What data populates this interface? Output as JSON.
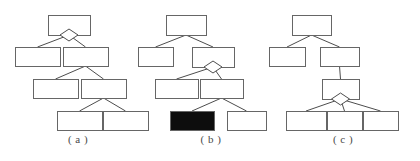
{
  "figure": {
    "type": "tree-diagram",
    "background_color": "#ffffff",
    "node_fill": "#ffffff",
    "node_stroke": "#666666",
    "node_highlight_fill": "#0d0d0d",
    "edge_color": "#4d4d4d",
    "diamond_stroke": "#4d4d4d",
    "caption_color": "#4a4a4a",
    "width": 420,
    "height": 161,
    "panel_count": 3
  },
  "panels": [
    {
      "id": "panel-a",
      "caption": "( a )",
      "caption_x": 78,
      "caption_y": 133,
      "marker_node": "root",
      "highlight_node": null,
      "levels": 4,
      "nodes": [
        {
          "id": "a-n0",
          "level": 0,
          "x": 48,
          "y": 15,
          "w": 42,
          "h": 20,
          "marker": true,
          "highlight": false
        },
        {
          "id": "a-n1",
          "level": 1,
          "x": 15,
          "y": 47,
          "w": 45,
          "h": 19,
          "marker": false,
          "highlight": false
        },
        {
          "id": "a-n2",
          "level": 1,
          "x": 63,
          "y": 47,
          "w": 45,
          "h": 19,
          "marker": false,
          "highlight": false
        },
        {
          "id": "a-n3",
          "level": 2,
          "x": 33,
          "y": 79,
          "w": 45,
          "h": 19,
          "marker": false,
          "highlight": false
        },
        {
          "id": "a-n4",
          "level": 2,
          "x": 81,
          "y": 79,
          "w": 45,
          "h": 19,
          "marker": false,
          "highlight": false
        },
        {
          "id": "a-n5",
          "level": 3,
          "x": 57,
          "y": 111,
          "w": 45,
          "h": 19,
          "marker": false,
          "highlight": false
        },
        {
          "id": "a-n6",
          "level": 3,
          "x": 103,
          "y": 111,
          "w": 45,
          "h": 19,
          "marker": false,
          "highlight": false
        }
      ],
      "edges": [
        {
          "from": "a-n0",
          "to": "a-n1"
        },
        {
          "from": "a-n0",
          "to": "a-n2"
        },
        {
          "from": "a-n2",
          "to": "a-n3"
        },
        {
          "from": "a-n2",
          "to": "a-n4"
        },
        {
          "from": "a-n4",
          "to": "a-n5"
        },
        {
          "from": "a-n4",
          "to": "a-n6"
        }
      ]
    },
    {
      "id": "panel-b",
      "caption": "( b )",
      "caption_x": 211,
      "caption_y": 133,
      "marker_node": "level1-right",
      "highlight_node": "b-n5",
      "levels": 4,
      "nodes": [
        {
          "id": "b-n0",
          "level": 0,
          "x": 166,
          "y": 15,
          "w": 40,
          "h": 20,
          "marker": false,
          "highlight": false
        },
        {
          "id": "b-n1",
          "level": 1,
          "x": 138,
          "y": 47,
          "w": 35,
          "h": 19,
          "marker": false,
          "highlight": false
        },
        {
          "id": "b-n2",
          "level": 1,
          "x": 192,
          "y": 47,
          "w": 42,
          "h": 20,
          "marker": true,
          "highlight": false
        },
        {
          "id": "b-n3",
          "level": 2,
          "x": 155,
          "y": 79,
          "w": 43,
          "h": 19,
          "marker": false,
          "highlight": false
        },
        {
          "id": "b-n4",
          "level": 2,
          "x": 200,
          "y": 79,
          "w": 43,
          "h": 19,
          "marker": false,
          "highlight": false
        },
        {
          "id": "b-n5",
          "level": 3,
          "x": 170,
          "y": 111,
          "w": 44,
          "h": 19,
          "marker": false,
          "highlight": true
        },
        {
          "id": "b-n6",
          "level": 3,
          "x": 227,
          "y": 111,
          "w": 39,
          "h": 19,
          "marker": false,
          "highlight": false
        }
      ],
      "edges": [
        {
          "from": "b-n0",
          "to": "b-n1"
        },
        {
          "from": "b-n0",
          "to": "b-n2"
        },
        {
          "from": "b-n2",
          "to": "b-n3"
        },
        {
          "from": "b-n2",
          "to": "b-n4"
        },
        {
          "from": "b-n4",
          "to": "b-n5"
        },
        {
          "from": "b-n4",
          "to": "b-n6"
        }
      ]
    },
    {
      "id": "panel-c",
      "caption": "( c )",
      "caption_x": 343,
      "caption_y": 133,
      "marker_node": "level2-single",
      "highlight_node": null,
      "levels": 4,
      "nodes": [
        {
          "id": "c-n0",
          "level": 0,
          "x": 292,
          "y": 15,
          "w": 39,
          "h": 20,
          "marker": false,
          "highlight": false
        },
        {
          "id": "c-n1",
          "level": 1,
          "x": 269,
          "y": 47,
          "w": 36,
          "h": 19,
          "marker": false,
          "highlight": false
        },
        {
          "id": "c-n2",
          "level": 1,
          "x": 320,
          "y": 47,
          "w": 39,
          "h": 19,
          "marker": false,
          "highlight": false
        },
        {
          "id": "c-n3",
          "level": 2,
          "x": 322,
          "y": 79,
          "w": 37,
          "h": 20,
          "marker": true,
          "highlight": false
        },
        {
          "id": "c-n4",
          "level": 3,
          "x": 286,
          "y": 111,
          "w": 40,
          "h": 19,
          "marker": false,
          "highlight": false
        },
        {
          "id": "c-n5",
          "level": 3,
          "x": 327,
          "y": 111,
          "w": 35,
          "h": 19,
          "marker": false,
          "highlight": false
        },
        {
          "id": "c-n6",
          "level": 3,
          "x": 363,
          "y": 111,
          "w": 35,
          "h": 19,
          "marker": false,
          "highlight": false
        }
      ],
      "edges": [
        {
          "from": "c-n0",
          "to": "c-n1"
        },
        {
          "from": "c-n0",
          "to": "c-n2"
        },
        {
          "from": "c-n2",
          "to": "c-n3"
        },
        {
          "from": "c-n3",
          "to": "c-n4"
        },
        {
          "from": "c-n3",
          "to": "c-n5"
        },
        {
          "from": "c-n3",
          "to": "c-n6"
        }
      ]
    }
  ]
}
